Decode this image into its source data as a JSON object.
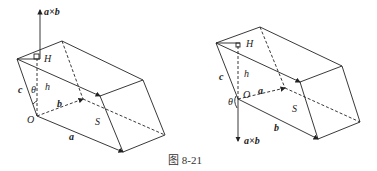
{
  "caption": "图 8-21",
  "left_figure": {
    "labels": {
      "cross": "a×b",
      "H": "H",
      "c": "c",
      "theta": "θ",
      "h": "h",
      "b": "b",
      "O": "O",
      "S": "S",
      "a": "a"
    }
  },
  "right_figure": {
    "labels": {
      "H": "H",
      "c": "c",
      "h": "h",
      "O": "O",
      "a": "a",
      "theta": "θ",
      "S": "S",
      "b": "b",
      "cross": "a×b"
    }
  },
  "colors": {
    "line": "#222222",
    "background": "#ffffff"
  }
}
